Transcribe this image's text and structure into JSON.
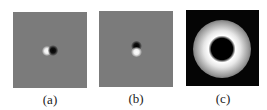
{
  "figure": {
    "panels": [
      {
        "id": "a",
        "label": "(a)",
        "description": "gray field with horizontal white-black dipole at center"
      },
      {
        "id": "b",
        "label": "(b)",
        "description": "gray field with vertical black-white dipole at center"
      },
      {
        "id": "c",
        "label": "(c)",
        "description": "black field with bright annular ring around dark center"
      }
    ],
    "colors": {
      "gray_background": "#7b7b7b",
      "black_background": "#050505",
      "highlight": "#ffffff"
    }
  }
}
